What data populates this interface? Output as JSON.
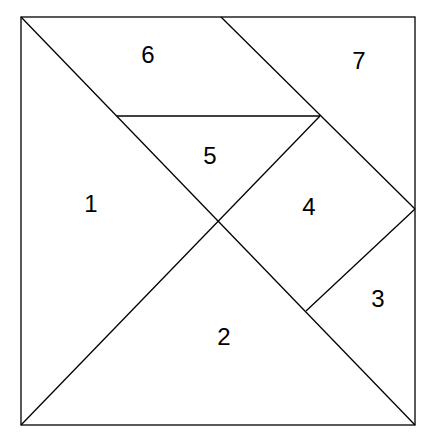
{
  "diagram": {
    "type": "tangram",
    "stroke_color": "#000000",
    "background": "#ffffff",
    "pieces": [
      {
        "id": "1",
        "label": "1",
        "shape": "large-triangle",
        "label_pos": [
          91,
          212
        ]
      },
      {
        "id": "2",
        "label": "2",
        "shape": "large-triangle",
        "label_pos": [
          224,
          345
        ]
      },
      {
        "id": "3",
        "label": "3",
        "shape": "small-triangle",
        "label_pos": [
          378,
          307
        ]
      },
      {
        "id": "4",
        "label": "4",
        "shape": "square",
        "label_pos": [
          309,
          215
        ]
      },
      {
        "id": "5",
        "label": "5",
        "shape": "small-triangle",
        "label_pos": [
          210,
          164
        ]
      },
      {
        "id": "6",
        "label": "6",
        "shape": "parallelogram",
        "label_pos": [
          148,
          63
        ]
      },
      {
        "id": "7",
        "label": "7",
        "shape": "medium-triangle",
        "label_pos": [
          359,
          69
        ]
      }
    ]
  }
}
